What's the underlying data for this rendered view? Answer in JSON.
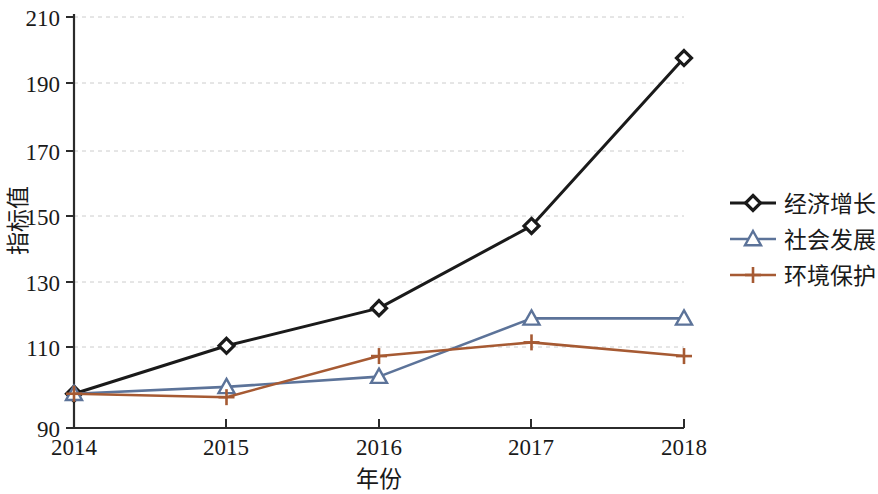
{
  "chart_data": {
    "type": "line",
    "title": "",
    "xlabel": "年份",
    "ylabel": "指标值",
    "categories": [
      "2014",
      "2015",
      "2016",
      "2017",
      "2018"
    ],
    "x": [
      2014,
      2015,
      2016,
      2017,
      2018
    ],
    "xlim": [
      2014,
      2018
    ],
    "ylim": [
      90,
      210
    ],
    "yticks": [
      90,
      110,
      130,
      150,
      170,
      190,
      210
    ],
    "ytick_labels": [
      "90",
      "110",
      "130",
      "150",
      "170",
      "190",
      "210"
    ],
    "grid": "horizontal-dashed",
    "legend_position": "right",
    "series": [
      {
        "name": "经济增长",
        "values": [
          100,
          114,
          125,
          149,
          198
        ],
        "color": "#1a1a1a",
        "marker": "diamond",
        "marker_fill": "#ffffff",
        "line_width": 3
      },
      {
        "name": "社会发展",
        "values": [
          100,
          102,
          105,
          122,
          122
        ],
        "color": "#5c7399",
        "marker": "triangle",
        "marker_fill": "#ffffff",
        "line_width": 2.6
      },
      {
        "name": "环境保护",
        "values": [
          100,
          99,
          111,
          115,
          111
        ],
        "color": "#a65a33",
        "marker": "plus",
        "marker_fill": "none",
        "line_width": 2.6
      }
    ]
  },
  "legend": {
    "items": [
      {
        "label": "经济增长"
      },
      {
        "label": "社会发展"
      },
      {
        "label": "环境保护"
      }
    ]
  },
  "axes": {
    "y_title": "指标值",
    "x_title": "年份",
    "y_tick_0": "90",
    "y_tick_1": "110",
    "y_tick_2": "130",
    "y_tick_3": "150",
    "y_tick_4": "170",
    "y_tick_5": "190",
    "y_tick_6": "210",
    "x_tick_0": "2014",
    "x_tick_1": "2015",
    "x_tick_2": "2016",
    "x_tick_3": "2017",
    "x_tick_4": "2018"
  }
}
